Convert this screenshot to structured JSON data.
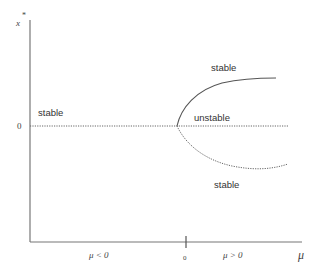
{
  "diagram": {
    "type": "pitchfork bifurcation diagram",
    "axes": {
      "y_label": "x",
      "y_label_superscript": "*",
      "x_label": "μ",
      "y_zero_tick": "0",
      "x_zero_tick": "0",
      "x_region_left": "μ < 0",
      "x_region_right": "μ > 0"
    },
    "region_labels": {
      "left_stable": "stable",
      "upper_stable": "stable",
      "middle_unstable": "unstable",
      "lower_stable": "stable"
    },
    "branches": [
      {
        "name": "trivial-left",
        "style": "dotted",
        "stability": "stable"
      },
      {
        "name": "trivial-right",
        "style": "dotted",
        "stability": "unstable"
      },
      {
        "name": "upper-branch",
        "style": "solid",
        "stability": "stable"
      },
      {
        "name": "lower-branch",
        "style": "dotted",
        "stability": "stable"
      }
    ],
    "colors": {
      "axis": "#777777",
      "curve": "#555555",
      "text": "#333333"
    }
  }
}
